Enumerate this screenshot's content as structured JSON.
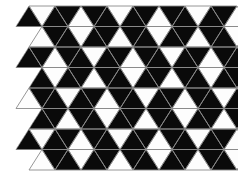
{
  "figure": {
    "type": "geometric-tiling",
    "canvas": {
      "width": 238,
      "height": 179
    },
    "background_color": "#ffffff"
  },
  "palette": {
    "dark_fill": "#0a0a0a",
    "light_fill": "#fdfdfd",
    "edge_stroke": "#8a8a8a",
    "edge_width": 0.9,
    "background": "#ffffff"
  },
  "geometry": {
    "description": "Equilateral-ish triangular grid; each row is a band of alternating up- and down-pointing triangles. Rows are offset horizontally by half a triangle width.",
    "origin_x": 16,
    "origin_y": 6,
    "triangle_half_width": 13.0,
    "row_height": 20.5,
    "columns": 17,
    "rows": 8,
    "row_offset_pattern": [
      0,
      0
    ]
  },
  "chart_data": {
    "type": "heatmap",
    "xlabel": "",
    "ylabel": "",
    "legend": [
      {
        "label": "dark triangle",
        "color": "#0a0a0a"
      },
      {
        "label": "light triangle",
        "color": "#fdfdfd"
      }
    ],
    "categories": [
      "col0",
      "col1",
      "col2",
      "col3",
      "col4",
      "col5",
      "col6",
      "col7",
      "col8",
      "col9",
      "col10",
      "col11",
      "col12",
      "col13",
      "col14",
      "col15",
      "col16"
    ],
    "grid": false,
    "note": "Value 1 = filled black triangle, 0 = white triangle. Each inner array is one row of triangles, alternating orientation up/down starting with up-pointing.",
    "rows": [
      [
        1,
        0,
        1,
        1,
        0,
        1,
        1,
        0,
        1,
        1,
        0,
        1,
        1,
        0,
        1,
        1,
        0
      ],
      [
        0,
        1,
        1,
        0,
        1,
        1,
        0,
        1,
        1,
        0,
        1,
        1,
        0,
        1,
        1,
        0,
        1
      ],
      [
        1,
        1,
        0,
        1,
        1,
        0,
        1,
        1,
        0,
        1,
        1,
        0,
        1,
        1,
        0,
        1,
        1
      ],
      [
        1,
        0,
        1,
        1,
        0,
        1,
        1,
        0,
        1,
        1,
        0,
        1,
        1,
        0,
        1,
        1,
        0
      ],
      [
        0,
        1,
        1,
        0,
        1,
        1,
        0,
        1,
        1,
        0,
        1,
        1,
        0,
        1,
        1,
        0,
        1
      ],
      [
        1,
        1,
        0,
        1,
        1,
        0,
        1,
        1,
        0,
        1,
        1,
        0,
        1,
        1,
        0,
        1,
        1
      ],
      [
        1,
        0,
        1,
        1,
        0,
        1,
        1,
        0,
        1,
        1,
        0,
        1,
        1,
        0,
        1,
        1,
        0
      ],
      [
        0,
        1,
        1,
        0,
        1,
        1,
        0,
        1,
        1,
        0,
        1,
        1,
        0,
        1,
        1,
        0,
        1
      ]
    ]
  }
}
